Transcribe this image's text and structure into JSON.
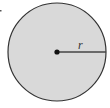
{
  "diagram": {
    "type": "circle-with-radius",
    "radius_label": "r",
    "colors": {
      "fill": "#d9d9d9",
      "stroke": "#333333",
      "radius_line": "#444444",
      "center_dot": "#111111",
      "background": "#ffffff"
    }
  }
}
